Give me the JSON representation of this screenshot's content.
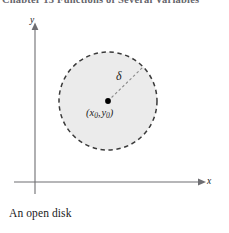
{
  "page": {
    "background_color": "#ffffff",
    "width": 229,
    "height": 233
  },
  "clipped_header": {
    "text": "Chapter 13   Functions of Several Variables"
  },
  "figure": {
    "name": "open-disk-diagram",
    "axes": {
      "y_label": "y",
      "x_label": "x",
      "axis_color": "#6e6e72",
      "origin_x": 35,
      "origin_y": 182
    },
    "disk": {
      "center_x": 108,
      "center_y": 101,
      "radius": 49,
      "fill_color": "#ebebeb",
      "boundary_color": "#3a3a3a",
      "boundary_style": "dashed",
      "boundary_open": true
    },
    "center_point": {
      "marker_color": "#000000",
      "label_open_paren": "(",
      "label_x": "x",
      "label_x_sub": "0",
      "label_comma": ",",
      "label_y": "y",
      "label_y_sub": "0",
      "label_close_paren": ")"
    },
    "radius_annotation": {
      "symbol": "δ",
      "line_style": "dashed",
      "line_color": "#8a8a8a",
      "from_x": 108,
      "from_y": 101,
      "to_x": 143,
      "to_y": 67
    }
  },
  "caption": {
    "text": "An open disk"
  }
}
